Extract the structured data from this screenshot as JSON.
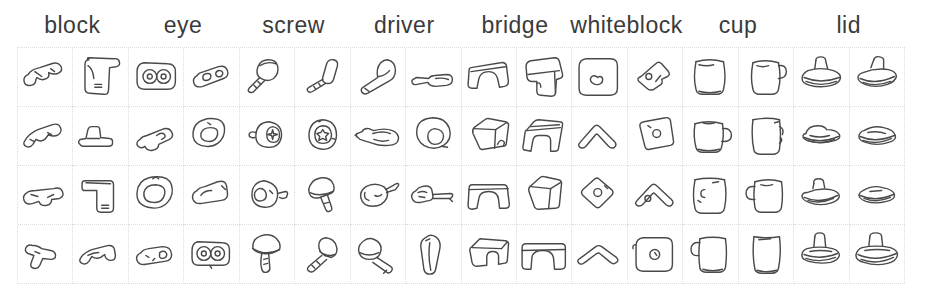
{
  "figure": {
    "background": "#ffffff",
    "sketch_line_color": "#4a4a4a",
    "grid_line_color": "#dcdcdc",
    "label_color": "#3a3a3a"
  },
  "categories": [
    {
      "label": "block"
    },
    {
      "label": "eye"
    },
    {
      "label": "screw"
    },
    {
      "label": "driver"
    },
    {
      "label": "bridge"
    },
    {
      "label": "whiteblock"
    },
    {
      "label": "cup"
    },
    {
      "label": "lid"
    }
  ],
  "grid": {
    "rows": 4,
    "columns": 16,
    "sketches_per_category": 8,
    "cells": [
      {
        "category": "block",
        "icon": "block-sketch-icon",
        "variant": 0
      },
      {
        "category": "block",
        "icon": "block-sketch-icon",
        "variant": 1
      },
      {
        "category": "eye",
        "icon": "eye-sketch-icon",
        "variant": 0
      },
      {
        "category": "eye",
        "icon": "eye-sketch-icon",
        "variant": 1
      },
      {
        "category": "screw",
        "icon": "screw-sketch-icon",
        "variant": 0
      },
      {
        "category": "screw",
        "icon": "screw-sketch-icon",
        "variant": 1
      },
      {
        "category": "driver",
        "icon": "driver-sketch-icon",
        "variant": 0
      },
      {
        "category": "driver",
        "icon": "driver-sketch-icon",
        "variant": 1
      },
      {
        "category": "bridge",
        "icon": "bridge-sketch-icon",
        "variant": 0
      },
      {
        "category": "bridge",
        "icon": "bridge-sketch-icon",
        "variant": 1
      },
      {
        "category": "whiteblock",
        "icon": "whiteblock-sketch-icon",
        "variant": 0
      },
      {
        "category": "whiteblock",
        "icon": "whiteblock-sketch-icon",
        "variant": 1
      },
      {
        "category": "cup",
        "icon": "cup-sketch-icon",
        "variant": 0
      },
      {
        "category": "cup",
        "icon": "cup-sketch-icon",
        "variant": 1
      },
      {
        "category": "lid",
        "icon": "lid-sketch-icon",
        "variant": 0
      },
      {
        "category": "lid",
        "icon": "lid-sketch-icon",
        "variant": 1
      },
      {
        "category": "block",
        "icon": "block-sketch-icon",
        "variant": 2
      },
      {
        "category": "block",
        "icon": "block-sketch-icon",
        "variant": 3
      },
      {
        "category": "eye",
        "icon": "eye-sketch-icon",
        "variant": 2
      },
      {
        "category": "eye",
        "icon": "eye-sketch-icon",
        "variant": 3
      },
      {
        "category": "screw",
        "icon": "screw-sketch-icon",
        "variant": 2
      },
      {
        "category": "screw",
        "icon": "screw-sketch-icon",
        "variant": 3
      },
      {
        "category": "driver",
        "icon": "driver-sketch-icon",
        "variant": 2
      },
      {
        "category": "driver",
        "icon": "driver-sketch-icon",
        "variant": 3
      },
      {
        "category": "bridge",
        "icon": "bridge-sketch-icon",
        "variant": 2
      },
      {
        "category": "bridge",
        "icon": "bridge-sketch-icon",
        "variant": 3
      },
      {
        "category": "whiteblock",
        "icon": "whiteblock-sketch-icon",
        "variant": 2
      },
      {
        "category": "whiteblock",
        "icon": "whiteblock-sketch-icon",
        "variant": 3
      },
      {
        "category": "cup",
        "icon": "cup-sketch-icon",
        "variant": 2
      },
      {
        "category": "cup",
        "icon": "cup-sketch-icon",
        "variant": 3
      },
      {
        "category": "lid",
        "icon": "lid-sketch-icon",
        "variant": 2
      },
      {
        "category": "lid",
        "icon": "lid-sketch-icon",
        "variant": 3
      },
      {
        "category": "block",
        "icon": "block-sketch-icon",
        "variant": 4
      },
      {
        "category": "block",
        "icon": "block-sketch-icon",
        "variant": 5
      },
      {
        "category": "eye",
        "icon": "eye-sketch-icon",
        "variant": 4
      },
      {
        "category": "eye",
        "icon": "eye-sketch-icon",
        "variant": 5
      },
      {
        "category": "screw",
        "icon": "screw-sketch-icon",
        "variant": 4
      },
      {
        "category": "screw",
        "icon": "screw-sketch-icon",
        "variant": 5
      },
      {
        "category": "driver",
        "icon": "driver-sketch-icon",
        "variant": 4
      },
      {
        "category": "driver",
        "icon": "driver-sketch-icon",
        "variant": 5
      },
      {
        "category": "bridge",
        "icon": "bridge-sketch-icon",
        "variant": 4
      },
      {
        "category": "bridge",
        "icon": "bridge-sketch-icon",
        "variant": 5
      },
      {
        "category": "whiteblock",
        "icon": "whiteblock-sketch-icon",
        "variant": 4
      },
      {
        "category": "whiteblock",
        "icon": "whiteblock-sketch-icon",
        "variant": 5
      },
      {
        "category": "cup",
        "icon": "cup-sketch-icon",
        "variant": 4
      },
      {
        "category": "cup",
        "icon": "cup-sketch-icon",
        "variant": 5
      },
      {
        "category": "lid",
        "icon": "lid-sketch-icon",
        "variant": 4
      },
      {
        "category": "lid",
        "icon": "lid-sketch-icon",
        "variant": 5
      },
      {
        "category": "block",
        "icon": "block-sketch-icon",
        "variant": 6
      },
      {
        "category": "block",
        "icon": "block-sketch-icon",
        "variant": 7
      },
      {
        "category": "eye",
        "icon": "eye-sketch-icon",
        "variant": 6
      },
      {
        "category": "eye",
        "icon": "eye-sketch-icon",
        "variant": 7
      },
      {
        "category": "screw",
        "icon": "screw-sketch-icon",
        "variant": 6
      },
      {
        "category": "screw",
        "icon": "screw-sketch-icon",
        "variant": 7
      },
      {
        "category": "driver",
        "icon": "driver-sketch-icon",
        "variant": 6
      },
      {
        "category": "driver",
        "icon": "driver-sketch-icon",
        "variant": 7
      },
      {
        "category": "bridge",
        "icon": "bridge-sketch-icon",
        "variant": 6
      },
      {
        "category": "bridge",
        "icon": "bridge-sketch-icon",
        "variant": 7
      },
      {
        "category": "whiteblock",
        "icon": "whiteblock-sketch-icon",
        "variant": 6
      },
      {
        "category": "whiteblock",
        "icon": "whiteblock-sketch-icon",
        "variant": 7
      },
      {
        "category": "cup",
        "icon": "cup-sketch-icon",
        "variant": 6
      },
      {
        "category": "cup",
        "icon": "cup-sketch-icon",
        "variant": 7
      },
      {
        "category": "lid",
        "icon": "lid-sketch-icon",
        "variant": 6
      },
      {
        "category": "lid",
        "icon": "lid-sketch-icon",
        "variant": 7
      }
    ]
  }
}
